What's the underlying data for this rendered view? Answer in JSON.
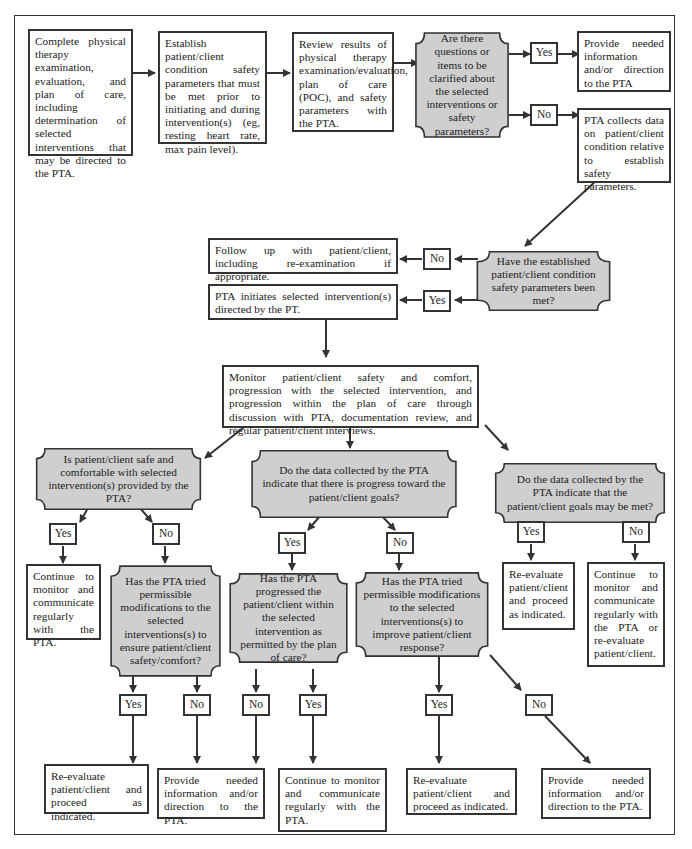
{
  "flowchart": {
    "fill_color": "#cfcfcf",
    "line_color": "#333333",
    "steps": {
      "s1": "Complete physical therapy examination, evaluation, and plan of care, including determination of selected interventions that may be directed to the PTA.",
      "s2": "Establish patient/client condition safety parameters that must be met prior to initiating and during intervention(s) (eg, resting heart rate, max pain level).",
      "s3": "Review results of physical therapy examination/evaluation, plan of care (POC), and safety parameters with the PTA.",
      "d1": "Are there questions or items to be clarified about the selected interventions or safety parameters?",
      "s4": "Provide needed information and/or direction to the PTA",
      "s5": "PTA collects data on patient/client condition relative to establish safety parameters.",
      "d2": "Have the established patient/client condition safety parameters been met?",
      "s6": "Follow up with patient/client, including re-examination if appropriate.",
      "s7": "PTA initiates selected intervention(s) directed by the PT.",
      "s8": "Monitor patient/client safety and comfort, progression with the selected intervention, and progression within the plan of care through discussion with PTA, documentation review, and regular patient/client interviews.",
      "d3": "Is patient/client safe and comfortable with selected intervention(s) provided by the PTA?",
      "d4": "Do the data collected by the PTA indicate that there is progress toward the patient/client goals?",
      "d5": "Do the data collected by the PTA indicate that the patient/client goals may be met?",
      "s9": "Continue to monitor and communicate regularly with the PTA.",
      "d6": "Has the PTA tried permissible modifications to the selected interventions(s) to ensure patient/client safety/comfort?",
      "d7": "Has the PTA progressed the patient/client within the selected intervention as permitted by the plan of care?",
      "d8": "Has the PTA tried permissible modifications to the selected interventions(s) to improve patient/client response?",
      "s10": "Re-evaluate patient/client and proceed as indicated.",
      "s11": "Continue to monitor and communicate regularly with the PTA or re-evaluate patient/client.",
      "s12": "Re-evaluate patient/client and proceed as indicated.",
      "s13": "Provide needed information and/or direction to the PTA.",
      "s14": "Continue to monitor and communicate regularly with the PTA.",
      "s15": "Re-evaluate patient/client and proceed as indicated.",
      "s16": "Provide needed information and/or direction to the PTA."
    },
    "labels": {
      "yes": "Yes",
      "no": "No"
    }
  }
}
